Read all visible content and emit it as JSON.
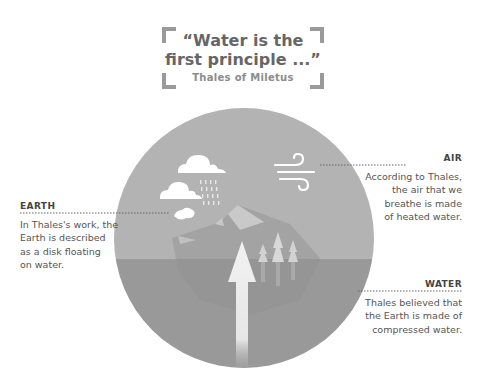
{
  "quote": {
    "text": "“Water is the first principle ...”",
    "line1": "“Water is the",
    "line2": "first principle ...”",
    "author": "Thales of Miletus"
  },
  "labels": {
    "air": {
      "title": "AIR",
      "lines": [
        "According to Thales,",
        "the air that we",
        "breathe is made",
        "of heated water."
      ]
    },
    "earth": {
      "title": "EARTH",
      "lines": [
        "In Thales's work, the",
        "Earth is described",
        "as a disk floating",
        "on water."
      ]
    },
    "water": {
      "title": "WATER",
      "lines": [
        "Thales believed that",
        "the Earth is made of",
        "compressed water."
      ]
    }
  },
  "colors": {
    "sky": "#b3b3b3",
    "water": "#999999",
    "mountain": "#a6a6a6",
    "mountain_dark": "#8f8f8f",
    "icon": "#ffffff",
    "bracket": "#9a9a9a"
  }
}
